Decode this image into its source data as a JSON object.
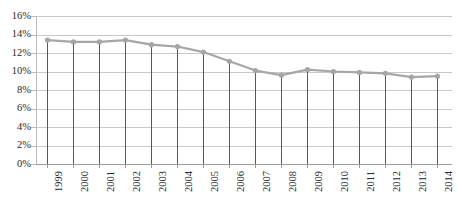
{
  "chart_data": {
    "type": "line",
    "title": "",
    "subtitle": "",
    "xlabel": "",
    "ylabel": "",
    "categories": [
      "1999",
      "2000",
      "2001",
      "2002",
      "2003",
      "2004",
      "2005",
      "2006",
      "2007",
      "2008",
      "2009",
      "2010",
      "2011",
      "2012",
      "2013",
      "2014"
    ],
    "values": [
      13.4,
      13.2,
      13.2,
      13.4,
      12.9,
      12.7,
      12.1,
      11.1,
      10.1,
      9.6,
      10.2,
      10.0,
      9.9,
      9.8,
      9.4,
      9.5
    ],
    "series": [
      {
        "name": "",
        "values": [
          13.4,
          13.2,
          13.2,
          13.4,
          12.9,
          12.7,
          12.1,
          11.1,
          10.1,
          9.6,
          10.2,
          10.0,
          9.9,
          9.8,
          9.4,
          9.5
        ]
      }
    ],
    "ylim": [
      0,
      16
    ],
    "ytick_step": 2,
    "ytick_labels": [
      "16%",
      "14%",
      "12%",
      "10%",
      "8%",
      "6%",
      "4%",
      "2%",
      "0%"
    ],
    "ytick_values": [
      16,
      14,
      12,
      10,
      8,
      6,
      4,
      2,
      0
    ],
    "value_suffix": "%",
    "grid": true,
    "grid_axis": "y",
    "legend": false,
    "legend_position": "none",
    "markers": true,
    "drop_lines": true,
    "colors": {
      "line": "#a6a6a6",
      "marker": "#a6a6a6",
      "gridline": "#c9c9c9",
      "drop_line": "#595959",
      "axis": "#9a9a9a",
      "text": "#2a2a2a",
      "background": "#ffffff"
    }
  }
}
